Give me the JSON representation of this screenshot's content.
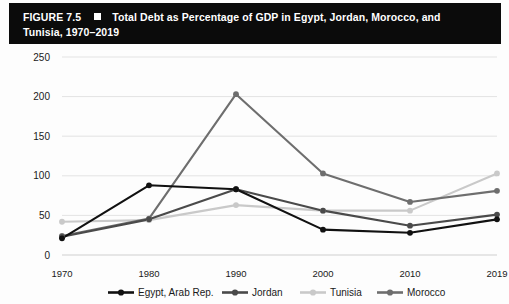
{
  "figure": {
    "label": "FIGURE 7.5",
    "marker_icon": "white-square-icon",
    "title_line1": "Total Debt as Percentage of GDP in Egypt, Jordan, Morocco, and",
    "title_line2": "Tunisia, 1970–2019"
  },
  "chart_data": {
    "type": "line",
    "title": "Total Debt as Percentage of GDP in Egypt, Jordan, Morocco, and Tunisia, 1970–2019",
    "xlabel": "",
    "ylabel": "",
    "categories": [
      "1970",
      "1980",
      "1990",
      "2000",
      "2010",
      "2019"
    ],
    "x_ticklabels": [
      "1970",
      "1980",
      "1990",
      "2000",
      "2010",
      "2019"
    ],
    "y_ticklabels": [
      "0",
      "50",
      "100",
      "150",
      "200",
      "250"
    ],
    "yticks": [
      0,
      50,
      100,
      150,
      200,
      250
    ],
    "ylim": [
      0,
      250
    ],
    "grid": "horizontal",
    "legend_position": "bottom",
    "markers": "circle",
    "series": [
      {
        "name": "Egypt, Arab Rep.",
        "color": "#111111",
        "values": [
          21,
          88,
          83,
          32,
          28,
          45
        ]
      },
      {
        "name": "Jordan",
        "color": "#4a4a4a",
        "values": [
          23,
          45,
          83,
          56,
          37,
          51
        ]
      },
      {
        "name": "Tunisia",
        "color": "#c9c9c9",
        "values": [
          42,
          44,
          63,
          56,
          56,
          103
        ]
      },
      {
        "name": "Morocco",
        "color": "#6e6e6e",
        "values": [
          24,
          46,
          203,
          103,
          67,
          81
        ]
      }
    ]
  },
  "legend": {
    "items": [
      {
        "label": "Egypt, Arab Rep.",
        "color": "#111111"
      },
      {
        "label": "Jordan",
        "color": "#4a4a4a"
      },
      {
        "label": "Tunisia",
        "color": "#c9c9c9"
      },
      {
        "label": "Morocco",
        "color": "#6e6e6e"
      }
    ]
  }
}
